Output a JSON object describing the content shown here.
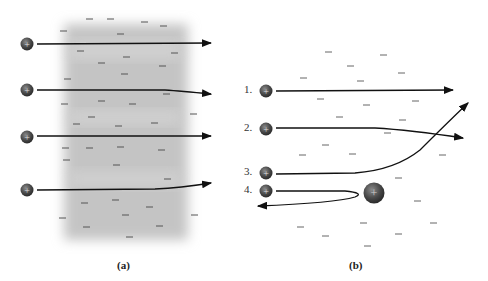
{
  "panel_a": {
    "caption": "(a)",
    "description": "Positive particles passing through a diffuse cloud of negative charge",
    "particles": [
      {
        "label": "+",
        "y": 44,
        "path": "straight"
      },
      {
        "label": "+",
        "y": 90,
        "path": "slight-deflection-down"
      },
      {
        "label": "+",
        "y": 136,
        "path": "straight"
      },
      {
        "label": "+",
        "y": 189,
        "path": "slight-deflection-up"
      }
    ],
    "charge_symbol": "−"
  },
  "panel_b": {
    "caption": "(b)",
    "description": "Positive particles scattering off a concentrated positive nucleus",
    "particles": [
      {
        "number": "1.",
        "label": "+",
        "y": 90,
        "path": "straight"
      },
      {
        "number": "2.",
        "label": "+",
        "y": 129,
        "path": "slight-deflection-down"
      },
      {
        "number": "3.",
        "label": "+",
        "y": 173,
        "path": "large-deflection-up"
      },
      {
        "number": "4.",
        "label": "+",
        "y": 190,
        "path": "backscatter"
      }
    ],
    "nucleus": {
      "label": "+"
    },
    "charge_symbol": "−"
  },
  "colors": {
    "particle": "#4a4a4a",
    "arrow": "#111111",
    "cloud": "#c8c8c8",
    "dash": "#555555"
  }
}
